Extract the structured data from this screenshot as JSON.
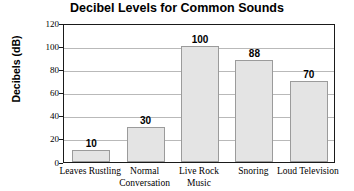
{
  "chart_data": {
    "type": "bar",
    "title": "Decibel Levels for Common Sounds",
    "xlabel": "",
    "ylabel": "Decibels (dB)",
    "categories": [
      "Leaves Rustling",
      "Normal Conversation",
      "Live Rock Music",
      "Snoring",
      "Loud Television"
    ],
    "values": [
      10,
      30,
      100,
      88,
      70
    ],
    "value_labels": [
      "10",
      "30",
      "100",
      "88",
      "70"
    ],
    "ylim": [
      0,
      120
    ],
    "ytick_step": 20,
    "yticks": [
      0,
      20,
      40,
      60,
      80,
      100,
      120
    ],
    "ytick_labels": [
      "0",
      "20",
      "40",
      "60",
      "80",
      "100",
      "120"
    ],
    "grid": true,
    "grid_axis": "y",
    "legend": false,
    "bar_fill_color": "#e4e4e4",
    "bar_border_color": "#9b9b9b",
    "grid_color": "#b9b9b9",
    "axis_color": "#1a1a1a",
    "background_color": "#ffffff"
  }
}
